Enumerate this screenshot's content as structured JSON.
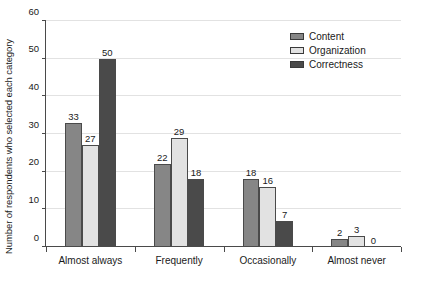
{
  "chart_data": {
    "type": "bar",
    "title": "",
    "xlabel": "",
    "ylabel": "Number of respondents who selected each category",
    "categories": [
      "Almost always",
      "Frequently",
      "Occasionally",
      "Almost never"
    ],
    "series": [
      {
        "name": "Content",
        "color": "#868686",
        "values": [
          33,
          22,
          18,
          2
        ]
      },
      {
        "name": "Organization",
        "color": "#e2e2e2",
        "values": [
          27,
          29,
          16,
          3
        ]
      },
      {
        "name": "Correctness",
        "color": "#4a4a4a",
        "values": [
          50,
          18,
          7,
          0
        ]
      }
    ],
    "ylim": [
      0,
      60
    ],
    "yticks": [
      0,
      10,
      20,
      30,
      40,
      50,
      60
    ],
    "grid": true,
    "legend_position": "top-right"
  }
}
